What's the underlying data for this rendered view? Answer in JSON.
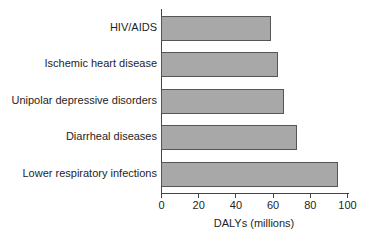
{
  "chart_data": {
    "type": "bar",
    "orientation": "horizontal",
    "title": "",
    "categories": [
      "HIV/AIDS",
      "Ischemic heart disease",
      "Unipolar depressive disorders",
      "Diarrheal diseases",
      "Lower respiratory infections"
    ],
    "values": [
      59,
      63,
      66,
      73,
      95
    ],
    "xlabel": "DALYs (millions)",
    "ylabel": "",
    "xlim": [
      0,
      100
    ],
    "xticks": [
      "0",
      "20",
      "40",
      "60",
      "80",
      "100"
    ],
    "grid": false,
    "legend": null,
    "bar_color": "#a8a8a8",
    "bar_edge_color": "#555555"
  }
}
